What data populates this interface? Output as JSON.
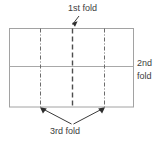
{
  "diagram": {
    "labels": {
      "first_fold": "1st fold",
      "second_fold_line1": "2nd",
      "second_fold_line2": "fold",
      "third_fold": "3rd fold"
    },
    "colors": {
      "outline": "#9a9a9a",
      "fold_line": "#6f6f6f",
      "center_fold_line": "#4a4a4a",
      "arrow": "#3a3a3a",
      "text": "#3d3d3d",
      "background": "#ffffff"
    },
    "geometry": {
      "rect_left": 9,
      "rect_top": 28,
      "rect_right": 134,
      "rect_bottom": 107,
      "horizontal_fold_y": 66,
      "vertical_fold_x": [
        40,
        72,
        104
      ]
    },
    "notes": {
      "first_fold_target": "center vertical line",
      "second_fold_target": "horizontal middle line",
      "third_fold_target": "left and right quarter vertical lines"
    }
  }
}
